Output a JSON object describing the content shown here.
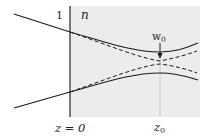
{
  "figure": {
    "type": "gaussian-beam-focusing-into-medium",
    "colors": {
      "background": "#ffffff",
      "medium_fill": "#ececec",
      "line": "#1a1a1a"
    },
    "labels": {
      "left_index": "1",
      "right_index": "n",
      "waist": "w",
      "waist_sub": "0",
      "interface_pos": "z = 0",
      "waist_pos": "z",
      "waist_pos_sub": "0"
    }
  }
}
